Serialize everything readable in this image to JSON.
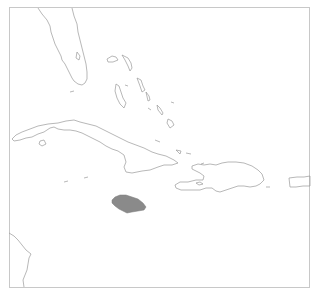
{
  "map": {
    "type": "locator-map",
    "region": "Caribbean",
    "highlighted_country": "Jamaica",
    "colors": {
      "background": "#ffffff",
      "coastline": "#9a9a9a",
      "highlight_fill": "#8a8a8a",
      "frame": "#c8c8c8"
    },
    "features": [
      {
        "name": "Florida",
        "highlighted": false
      },
      {
        "name": "Bahamas",
        "highlighted": false
      },
      {
        "name": "Cuba",
        "highlighted": false
      },
      {
        "name": "Jamaica",
        "highlighted": true
      },
      {
        "name": "Hispaniola",
        "highlighted": false
      },
      {
        "name": "Puerto Rico",
        "highlighted": false
      },
      {
        "name": "Central America",
        "highlighted": false
      }
    ]
  }
}
